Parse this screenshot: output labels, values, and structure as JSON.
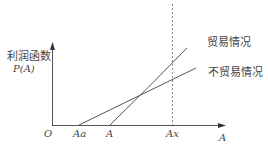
{
  "diagram": {
    "y_axis_label_cn": "利润函数",
    "y_axis_label_fn": "P(A)",
    "x_axis_label": "A",
    "origin_label": "O",
    "x_ticks": [
      {
        "label": "Aa"
      },
      {
        "label": "A"
      },
      {
        "label": "Ax"
      }
    ],
    "curves": [
      {
        "name": "trade",
        "label": "贸易情况"
      },
      {
        "name": "no-trade",
        "label": "不贸易情况"
      }
    ],
    "colors": {
      "line": "#555555",
      "text": "#444444",
      "dashed": "#888888"
    }
  }
}
